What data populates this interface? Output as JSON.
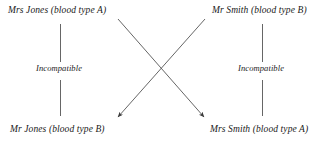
{
  "diagram": {
    "background_color": "#ffffff",
    "line_color": "#555555",
    "text_color": "#1a1a1a",
    "nodes": [
      {
        "id": "top-left",
        "label": "Mrs Jones (blood type A)",
        "person": "Mrs Jones",
        "blood_type": "A",
        "x": 8,
        "y": 5
      },
      {
        "id": "top-right",
        "label": "Mr Smith (blood type B)",
        "person": "Mr Smith",
        "blood_type": "B",
        "x": 212,
        "y": 5
      },
      {
        "id": "bottom-left",
        "label": "Mr Jones (blood type B)",
        "person": "Mr Jones",
        "blood_type": "B",
        "x": 10,
        "y": 124
      },
      {
        "id": "bottom-right",
        "label": "Mrs Smith (blood type A)",
        "person": "Mrs Smith",
        "blood_type": "A",
        "x": 210,
        "y": 124
      }
    ],
    "edges": [
      {
        "id": "vertical-left",
        "label": "Incompatible",
        "from": "top-left",
        "to": "bottom-left",
        "style": "plain-line",
        "arrow": false
      },
      {
        "id": "vertical-right",
        "label": "Incompatible",
        "from": "top-right",
        "to": "bottom-right",
        "style": "plain-line",
        "arrow": false
      },
      {
        "id": "diagonal-left-to-right",
        "label": "",
        "from": "top-left",
        "to": "bottom-right",
        "style": "arrow",
        "arrow": true
      },
      {
        "id": "diagonal-right-to-left",
        "label": "",
        "from": "top-right",
        "to": "bottom-left",
        "style": "arrow",
        "arrow": true
      }
    ]
  }
}
